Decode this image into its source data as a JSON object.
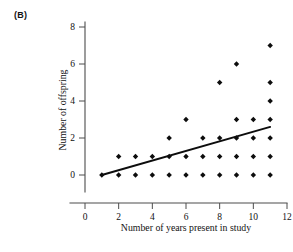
{
  "figure": {
    "panel_label": "(B)",
    "background_color": "#ffffff",
    "ink_color": "#0d0d0d",
    "axis_color": "#4c4c4c"
  },
  "chart_data": {
    "type": "scatter",
    "title": "",
    "panel": "(B)",
    "xlabel": "Number of years present in study",
    "ylabel": "Number of offspring",
    "xlim": [
      0,
      12
    ],
    "ylim": [
      0,
      8
    ],
    "xticks": [
      0,
      2,
      4,
      6,
      8,
      10,
      12
    ],
    "yticks": [
      0,
      2,
      4,
      6,
      8
    ],
    "xticklabels": [
      "0",
      "2",
      "4",
      "6",
      "8",
      "10",
      "12"
    ],
    "yticklabels": [
      "0",
      "2",
      "4",
      "6",
      "8"
    ],
    "grid": false,
    "legend": false,
    "marker": "diamond",
    "marker_color": "#0d0d0d",
    "points": [
      {
        "x": 1,
        "y": 0
      },
      {
        "x": 2,
        "y": 0
      },
      {
        "x": 3,
        "y": 0
      },
      {
        "x": 4,
        "y": 0
      },
      {
        "x": 5,
        "y": 0
      },
      {
        "x": 6,
        "y": 0
      },
      {
        "x": 7,
        "y": 0
      },
      {
        "x": 8,
        "y": 0
      },
      {
        "x": 9,
        "y": 0
      },
      {
        "x": 10,
        "y": 0
      },
      {
        "x": 11,
        "y": 0
      },
      {
        "x": 2,
        "y": 1
      },
      {
        "x": 3,
        "y": 1
      },
      {
        "x": 4,
        "y": 1
      },
      {
        "x": 5,
        "y": 1
      },
      {
        "x": 6,
        "y": 1
      },
      {
        "x": 7,
        "y": 1
      },
      {
        "x": 8,
        "y": 1
      },
      {
        "x": 9,
        "y": 1
      },
      {
        "x": 10,
        "y": 1
      },
      {
        "x": 11,
        "y": 1
      },
      {
        "x": 5,
        "y": 2
      },
      {
        "x": 7,
        "y": 2
      },
      {
        "x": 8,
        "y": 2
      },
      {
        "x": 9,
        "y": 2
      },
      {
        "x": 10,
        "y": 2
      },
      {
        "x": 11,
        "y": 2
      },
      {
        "x": 6,
        "y": 3
      },
      {
        "x": 9,
        "y": 3
      },
      {
        "x": 10,
        "y": 3
      },
      {
        "x": 11,
        "y": 3
      },
      {
        "x": 11,
        "y": 4
      },
      {
        "x": 8,
        "y": 5
      },
      {
        "x": 11,
        "y": 5
      },
      {
        "x": 9,
        "y": 6
      },
      {
        "x": 11,
        "y": 7
      }
    ],
    "fit_line": {
      "name": "regression line",
      "x_start": 1,
      "y_start": 0,
      "x_end": 11,
      "y_end": 2.6,
      "color": "#0d0d0d"
    }
  }
}
